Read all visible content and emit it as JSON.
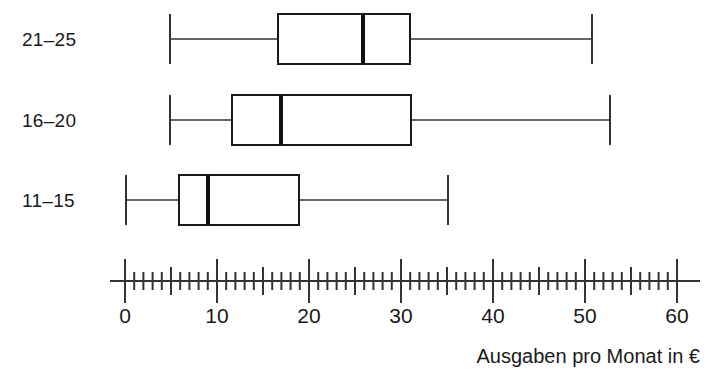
{
  "chart_data": {
    "type": "box",
    "title": "",
    "xlabel": "Ausgaben pro Monat in €",
    "ylabel": "",
    "xlim": [
      0,
      62
    ],
    "grid": false,
    "legend": "none",
    "orientation": "horizontal",
    "categories": [
      "21–25",
      "16–20",
      "11–15"
    ],
    "xticks": [
      0,
      10,
      20,
      30,
      40,
      50,
      60
    ],
    "xtick_labels": [
      "0",
      "10",
      "20",
      "30",
      "40",
      "50",
      "60"
    ],
    "minor_tick_step": 1,
    "mid_tick_step": 5,
    "major_tick_step": 10,
    "boxes": [
      {
        "category": "21–25",
        "min": 5,
        "q1": 17,
        "median": 26,
        "q3": 31,
        "max": 51
      },
      {
        "category": "16–20",
        "min": 5,
        "q1": 12,
        "median": 17,
        "q3": 31,
        "max": 53
      },
      {
        "category": "11–15",
        "min": 0,
        "q1": 6,
        "median": 9,
        "q3": 19,
        "max": 35
      }
    ]
  },
  "labels": {
    "cat_0": "21–25",
    "cat_1": "16–20",
    "cat_2": "11–15",
    "tick_0": "0",
    "tick_1": "10",
    "tick_2": "20",
    "tick_3": "30",
    "tick_4": "40",
    "tick_5": "50",
    "tick_6": "60",
    "axis_title": "Ausgaben pro Monat in €"
  },
  "colors": {
    "ink": "#1a1a1a",
    "line": "#333333",
    "background": "#ffffff"
  }
}
